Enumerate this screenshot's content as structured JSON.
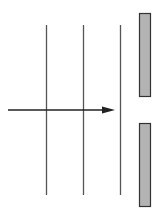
{
  "diagram": {
    "type": "plane-wave-single-slit",
    "colors": {
      "background": "#ffffff",
      "wavefront": "#555555",
      "arrow": "#222222",
      "barrier_fill": "#b3b3b3",
      "barrier_stroke": "#333333"
    },
    "wavefronts": [
      {
        "x": 46.5,
        "y1": 25,
        "y2": 195
      },
      {
        "x": 83.5,
        "y1": 25,
        "y2": 195
      },
      {
        "x": 120.5,
        "y1": 25,
        "y2": 195
      }
    ],
    "arrow": {
      "x1": 8,
      "x2": 115,
      "y": 110,
      "head_length": 13,
      "head_half_width": 3.5
    },
    "barrier": {
      "top": {
        "x": 139.5,
        "y": 13.5,
        "width": 11,
        "height": 83
      },
      "bottom": {
        "x": 139.5,
        "y": 123.5,
        "width": 11,
        "height": 83
      }
    }
  }
}
